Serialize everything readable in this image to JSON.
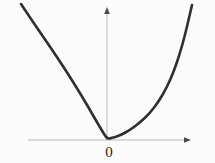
{
  "figure": {
    "width": 215,
    "height": 163,
    "background": "#fcfcfc"
  },
  "chart_data": {
    "type": "line",
    "title": "",
    "function": "y = x^2",
    "origin_label": "0",
    "x_range": [
      -2,
      2
    ],
    "y_range": [
      0,
      4
    ],
    "math_points": {
      "x": [
        -2,
        -1.5,
        -1,
        -0.5,
        0,
        0.5,
        1,
        1.5,
        2
      ],
      "y": [
        4,
        2.25,
        1,
        0.25,
        0,
        0.25,
        1,
        2.25,
        4
      ]
    },
    "axes": {
      "x_axis": {
        "x1": 28,
        "y1": 140,
        "x2": 184,
        "y2": 140
      },
      "y_axis": {
        "x1": 107,
        "y1": 140,
        "x2": 107,
        "y2": 13
      }
    },
    "origin_px": [
      107,
      140
    ],
    "curve_points_px": [
      [
        21,
        4
      ],
      [
        31,
        19
      ],
      [
        44,
        38
      ],
      [
        57,
        57
      ],
      [
        70,
        77
      ],
      [
        83,
        98
      ],
      [
        94,
        117
      ],
      [
        101,
        129
      ],
      [
        105,
        135.5
      ],
      [
        107.5,
        138.8
      ],
      [
        112,
        138
      ],
      [
        120,
        135.5
      ],
      [
        130,
        130
      ],
      [
        140,
        122.5
      ],
      [
        150,
        113
      ],
      [
        159,
        101
      ],
      [
        167,
        87
      ],
      [
        174,
        71
      ],
      [
        180,
        53
      ],
      [
        185,
        35
      ],
      [
        189,
        18
      ],
      [
        192,
        5
      ]
    ],
    "grid": false,
    "legend": false,
    "colors": {
      "curve": "#2f2f2f",
      "axis": "#b9b9b9",
      "arrow": "#4a4a4a",
      "label": "#1e1e1e",
      "background": "#fcfcfc"
    }
  }
}
